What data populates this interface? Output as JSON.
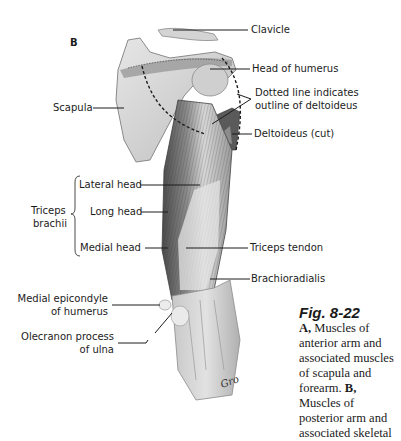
{
  "figure": {
    "panel_label": "B",
    "number": "Fig. 8-22",
    "caption": {
      "a_label": "A,",
      "a_text": " Muscles of anterior arm and associated muscles of scapula and forearm.",
      "b_label": "B,",
      "b_text": " Muscles of posterior arm and associated skeletal"
    },
    "signature": "Gro"
  },
  "labels": {
    "clavicle": "Clavicle",
    "head_of_humerus": "Head of humerus",
    "dotted_line_1": "Dotted line indicates",
    "dotted_line_2": "outline of deltoideus",
    "deltoideus": "Deltoideus (cut)",
    "scapula": "Scapula",
    "triceps_1": "Triceps",
    "triceps_2": "brachii",
    "lateral_head": "Lateral head",
    "long_head": "Long head",
    "medial_head": "Medial head",
    "triceps_tendon": "Triceps tendon",
    "brachioradialis": "Brachioradialis",
    "medial_epicondyle_1": "Medial epicondyle",
    "medial_epicondyle_2": "of humerus",
    "olecranon_1": "Olecranon process",
    "olecranon_2": "of ulna"
  },
  "colors": {
    "bone": "#d9d9d9",
    "muscle_dark": "#6e6e6e",
    "ink": "#1c1c1c"
  }
}
